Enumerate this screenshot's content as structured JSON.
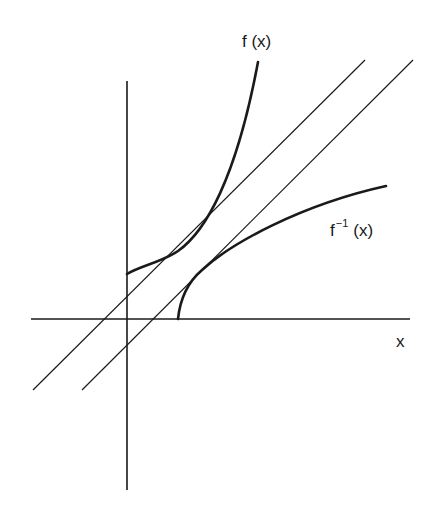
{
  "diagram": {
    "labels": {
      "f": "f (x)",
      "finv_base": "f",
      "finv_sup": "−1",
      "finv_arg": "(x)",
      "x_axis": "x"
    },
    "colors": {
      "stroke": "#1a1a1a",
      "background": "#ffffff"
    },
    "axes": {
      "origin_px": [
        127,
        319
      ],
      "x_axis_px": {
        "from": [
          31,
          319
        ],
        "to": [
          410,
          319
        ]
      },
      "y_axis_px": {
        "from": [
          127,
          81
        ],
        "to": [
          127,
          490
        ]
      }
    },
    "lines": [
      {
        "name": "tangent-line-upper",
        "from": [
          33,
          390
        ],
        "to": [
          365,
          60
        ]
      },
      {
        "name": "tangent-line-lower",
        "from": [
          82,
          390
        ],
        "to": [
          413,
          60
        ]
      }
    ],
    "curves": [
      {
        "name": "f-curve",
        "path": "M127,274 C140,266 162,262 178,251 C205,232 236,180 258,62"
      },
      {
        "name": "f-inverse-curve",
        "path": "M178,319 C180,300 188,282 202,270 C230,244 300,205 386,186"
      }
    ]
  }
}
